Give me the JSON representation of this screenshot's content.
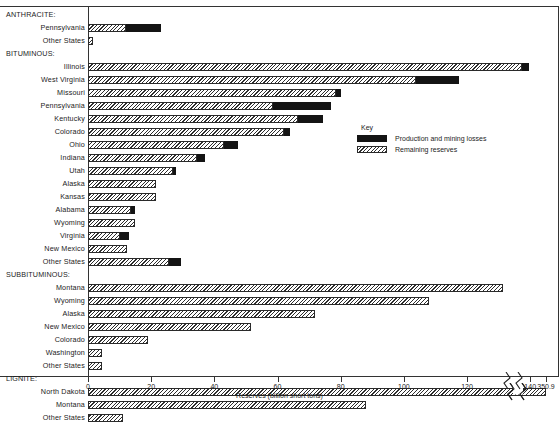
{
  "chart_data": {
    "type": "bar",
    "orientation": "horizontal",
    "title": "",
    "xlabel": "Reserves (billion short tons)",
    "ylabel": "",
    "xlim": [
      0,
      150
    ],
    "grid": false,
    "axis_break": {
      "after": 145,
      "last_tick_label": "350.9"
    },
    "xticks": [
      0,
      20,
      40,
      60,
      80,
      100,
      120,
      140
    ],
    "xtick_labels": [
      "0",
      "20",
      "40",
      "60",
      "80",
      "100",
      "120",
      "140",
      "350.9"
    ],
    "legend_position": "inside-right",
    "legend": [
      {
        "name": "Production and mining losses",
        "style": "solid-black"
      },
      {
        "name": "Remaining reserves",
        "style": "hatched"
      }
    ],
    "groups": [
      {
        "name": "ANTHRACITE:",
        "rows": [
          {
            "label": "Pennsylvania",
            "remaining": 12.0,
            "production": 11.0,
            "total": 23.0
          },
          {
            "label": "Other States",
            "remaining": 1.5,
            "production": 0.0,
            "total": 1.5
          }
        ]
      },
      {
        "name": "BITUMINOUS:",
        "rows": [
          {
            "label": "Illinois",
            "remaining": 137.5,
            "production": 2.0,
            "total": 139.5
          },
          {
            "label": "West Virginia",
            "remaining": 104.0,
            "production": 13.5,
            "total": 117.5
          },
          {
            "label": "Missouri",
            "remaining": 78.5,
            "production": 1.5,
            "total": 80.0
          },
          {
            "label": "Pennsylvania",
            "remaining": 58.5,
            "production": 18.5,
            "total": 77.0
          },
          {
            "label": "Kentucky",
            "remaining": 66.5,
            "production": 8.0,
            "total": 74.5
          },
          {
            "label": "Colorado",
            "remaining": 62.0,
            "production": 2.0,
            "total": 64.0
          },
          {
            "label": "Ohio",
            "remaining": 43.0,
            "production": 4.5,
            "total": 47.5
          },
          {
            "label": "Indiana",
            "remaining": 34.5,
            "production": 2.5,
            "total": 37.0
          },
          {
            "label": "Utah",
            "remaining": 27.0,
            "production": 1.0,
            "total": 28.0
          },
          {
            "label": "Alaska",
            "remaining": 21.5,
            "production": 0.0,
            "total": 21.5
          },
          {
            "label": "Kansas",
            "remaining": 21.5,
            "production": 0.0,
            "total": 21.5
          },
          {
            "label": "Alabama",
            "remaining": 13.5,
            "production": 1.5,
            "total": 15.0
          },
          {
            "label": "Wyoming",
            "remaining": 15.0,
            "production": 0.0,
            "total": 15.0
          },
          {
            "label": "Virginia",
            "remaining": 10.0,
            "production": 3.0,
            "total": 13.0
          },
          {
            "label": "New Mexico",
            "remaining": 12.5,
            "production": 0.0,
            "total": 12.5
          },
          {
            "label": "Other States",
            "remaining": 25.5,
            "production": 4.0,
            "total": 29.5
          }
        ]
      },
      {
        "name": "SUBBITUMINOUS:",
        "rows": [
          {
            "label": "Montana",
            "remaining": 131.5,
            "production": 0.0,
            "total": 131.5
          },
          {
            "label": "Wyoming",
            "remaining": 108.0,
            "production": 0.0,
            "total": 108.0
          },
          {
            "label": "Alaska",
            "remaining": 72.0,
            "production": 0.0,
            "total": 72.0
          },
          {
            "label": "New Mexico",
            "remaining": 51.5,
            "production": 0.0,
            "total": 51.5
          },
          {
            "label": "Colorado",
            "remaining": 19.0,
            "production": 0.0,
            "total": 19.0
          },
          {
            "label": "Washington",
            "remaining": 4.5,
            "production": 0.0,
            "total": 4.5
          },
          {
            "label": "Other States",
            "remaining": 4.5,
            "production": 0.0,
            "total": 4.5
          }
        ]
      },
      {
        "name": "LIGNITE:",
        "rows": [
          {
            "label": "North Dakota",
            "remaining": 350.9,
            "production": 0.0,
            "total": 350.9,
            "broken": true
          },
          {
            "label": "Montana",
            "remaining": 88.0,
            "production": 0.0,
            "total": 88.0
          },
          {
            "label": "Other States",
            "remaining": 11.0,
            "production": 0.0,
            "total": 11.0
          }
        ]
      }
    ]
  },
  "legend": {
    "title": "Key",
    "items": [
      {
        "label": "Production and mining losses"
      },
      {
        "label": "Remaining reserves"
      }
    ]
  },
  "axis": {
    "title": "Reserves (billion short tons)"
  }
}
